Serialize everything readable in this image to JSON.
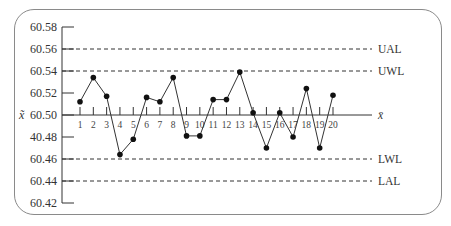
{
  "chart_data": {
    "type": "line",
    "title": "",
    "xlabel": "",
    "ylabel": "x̃",
    "ylim": [
      60.42,
      60.58
    ],
    "y_ticks": [
      "60.58",
      "60.56",
      "60.54",
      "60.52",
      "60.50",
      "40.48",
      "60.46",
      "60.44",
      "60.42"
    ],
    "x": [
      1,
      2,
      3,
      4,
      5,
      6,
      7,
      8,
      9,
      10,
      11,
      12,
      13,
      14,
      15,
      16,
      17,
      18,
      19,
      20
    ],
    "series": [
      {
        "name": "median",
        "values": [
          60.512,
          60.534,
          60.517,
          60.464,
          60.478,
          60.516,
          60.512,
          60.534,
          60.481,
          60.481,
          60.514,
          60.514,
          60.539,
          60.502,
          60.47,
          60.502,
          60.48,
          60.524,
          60.47,
          60.518
        ]
      }
    ],
    "reference_lines": [
      {
        "label": "UAL",
        "value": 60.56,
        "style": "dashed"
      },
      {
        "label": "UWL",
        "value": 60.54,
        "style": "dashed"
      },
      {
        "label": "x̄",
        "value": 60.5,
        "style": "solid"
      },
      {
        "label": "LWL",
        "value": 60.46,
        "style": "dashed"
      },
      {
        "label": "LAL",
        "value": 60.44,
        "style": "dashed"
      }
    ],
    "grid": false,
    "legend": "none"
  },
  "colors": {
    "line": "#333333",
    "frame": "#8a8a8a",
    "marker": "#111111"
  }
}
